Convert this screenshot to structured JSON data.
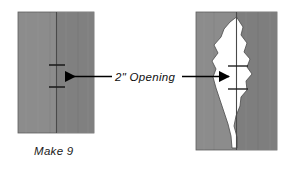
{
  "diagram": {
    "title_label": "2\" Opening",
    "caption_label": "Make 9",
    "colors": {
      "fabric_light": "#8a8a8a",
      "fabric_dark": "#7c7c7c",
      "opening_fill": "#ffffff",
      "outline": "#3a3a3a",
      "arrow": "#000000",
      "text": "#101010",
      "background": "#ffffff"
    },
    "pieces": [
      {
        "name": "flat-fabric-piece",
        "kind": "rectangle",
        "caption": "Make 9",
        "has_center_seam": true,
        "tick_marks": 2,
        "opening_state": "closed"
      },
      {
        "name": "turned-fabric-piece",
        "kind": "rectangle-with-opening",
        "caption": "",
        "has_center_seam": true,
        "tick_marks": 2,
        "opening_state": "open"
      }
    ],
    "annotations": [
      {
        "name": "opening-callout",
        "text": "2\" Opening",
        "arrow_left": "points-to-left-piece",
        "arrow_right": "points-to-right-piece"
      }
    ]
  }
}
